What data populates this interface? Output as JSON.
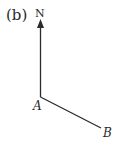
{
  "figure": {
    "label": "(b)",
    "north_label": "N",
    "point_a": "A",
    "point_b": "B",
    "colors": {
      "line": "#2a2a2a",
      "background": "#ffffff"
    }
  }
}
